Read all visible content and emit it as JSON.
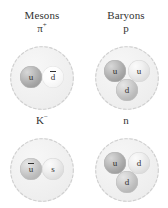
{
  "figure": {
    "background_color": "#ffffff",
    "shell_fill_color": "#f0f0f0",
    "shell_outline_color": "#cfcfcf",
    "label_color": "#333333"
  },
  "columns": [
    {
      "id": "mesons",
      "header": "Mesons"
    },
    {
      "id": "baryons",
      "header": "Baryons"
    }
  ],
  "particles": [
    {
      "id": "pi-plus",
      "column": "mesons",
      "row": 1,
      "symbol": "π",
      "superscript": "+",
      "kind": "meson",
      "quark_count": 2,
      "quarks": [
        {
          "label": "u",
          "overbar": false,
          "tone": "dark",
          "position": "left"
        },
        {
          "label": "d",
          "overbar": true,
          "tone": "white",
          "position": "right"
        }
      ]
    },
    {
      "id": "proton",
      "column": "baryons",
      "row": 1,
      "symbol": "p",
      "superscript": "",
      "kind": "baryon",
      "quark_count": 3,
      "quarks": [
        {
          "label": "u",
          "overbar": false,
          "tone": "dark",
          "position": "top-left"
        },
        {
          "label": "u",
          "overbar": false,
          "tone": "light",
          "position": "top-right"
        },
        {
          "label": "d",
          "overbar": false,
          "tone": "mid",
          "position": "bottom"
        }
      ]
    },
    {
      "id": "k-minus",
      "column": "mesons",
      "row": 2,
      "symbol": "K",
      "superscript": "−",
      "kind": "meson",
      "quark_count": 2,
      "quarks": [
        {
          "label": "u",
          "overbar": true,
          "tone": "mid",
          "position": "left"
        },
        {
          "label": "s",
          "overbar": false,
          "tone": "light",
          "position": "right"
        }
      ]
    },
    {
      "id": "neutron",
      "column": "baryons",
      "row": 2,
      "symbol": "n",
      "superscript": "",
      "kind": "baryon",
      "quark_count": 3,
      "quarks": [
        {
          "label": "u",
          "overbar": false,
          "tone": "dark",
          "position": "top-left"
        },
        {
          "label": "d",
          "overbar": false,
          "tone": "light",
          "position": "top-right"
        },
        {
          "label": "d",
          "overbar": false,
          "tone": "mid",
          "position": "bottom"
        }
      ]
    }
  ]
}
